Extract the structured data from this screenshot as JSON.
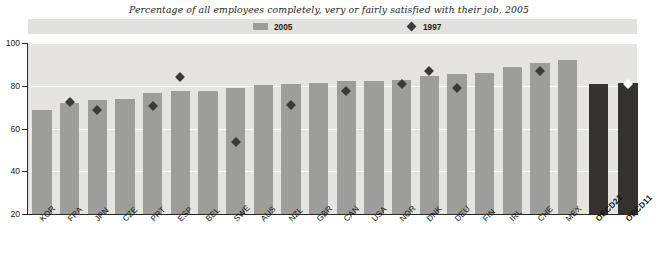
{
  "chart_data": {
    "type": "bar",
    "title": "Percentage of all employees completely, very or fairly satisfied with their job, 2005",
    "xlabel": "",
    "ylabel": "",
    "ylim": [
      20,
      100
    ],
    "yticks": [
      20,
      40,
      60,
      80,
      100
    ],
    "grid": true,
    "legend_position": "top-center",
    "categories": [
      "KOR",
      "FRA",
      "JPN",
      "CZE",
      "PRT",
      "ESP",
      "BEL",
      "SWE",
      "AUS",
      "NZL",
      "GBR",
      "CAN",
      "USA",
      "NOR",
      "DNK",
      "DEU",
      "FIN",
      "IRL",
      "CHE",
      "MEX",
      "OECD21",
      "OECD11"
    ],
    "series": [
      {
        "name": "2005",
        "type": "bar",
        "color": "#9d9d9b",
        "highlight_color": "#353330",
        "values": [
          68.5,
          72.0,
          73.5,
          74.0,
          76.5,
          77.5,
          77.5,
          79.0,
          80.5,
          81.0,
          81.5,
          82.0,
          82.0,
          82.5,
          84.5,
          85.5,
          86.0,
          89.0,
          90.5,
          92.0,
          81.0,
          81.5
        ],
        "highlight_categories": [
          "OECD21",
          "OECD11"
        ]
      },
      {
        "name": "1997",
        "type": "scatter",
        "marker": "diamond",
        "color": "#3a3a3a",
        "inverted_color": "#ffffff",
        "points": [
          {
            "category": "FRA",
            "value": 72.5
          },
          {
            "category": "JPN",
            "value": 68.5
          },
          {
            "category": "PRT",
            "value": 70.5
          },
          {
            "category": "ESP",
            "value": 84.0
          },
          {
            "category": "SWE",
            "value": 53.5
          },
          {
            "category": "NZL",
            "value": 71.0
          },
          {
            "category": "CAN",
            "value": 77.5
          },
          {
            "category": "NOR",
            "value": 81.0
          },
          {
            "category": "DNK",
            "value": 87.0
          },
          {
            "category": "DEU",
            "value": 79.0
          },
          {
            "category": "CHE",
            "value": 87.0
          },
          {
            "category": "OECD11",
            "value": 81.0,
            "inverted": true
          }
        ]
      }
    ]
  },
  "legend": {
    "items": [
      {
        "label": "2005",
        "symbol": "square-swatch"
      },
      {
        "label": "1997",
        "symbol": "diamond-marker"
      }
    ]
  },
  "colors": {
    "panel_background": "#e6e4e0",
    "legend_background": "#e3e1dd",
    "bar": "#9d9d9b",
    "bar_highlight": "#353330",
    "marker": "#3a3a3a",
    "gridline": "#ffffff",
    "axis": "#2b2724",
    "text": "#1d1a18",
    "page_background": "#ffffff"
  }
}
